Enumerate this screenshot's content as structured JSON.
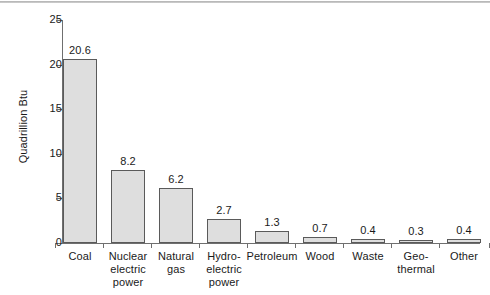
{
  "chart_data": {
    "type": "bar",
    "title": "",
    "subtitle": "",
    "xlabel": "",
    "ylabel": "Quadrillion Btu",
    "ylim": [
      0,
      25
    ],
    "ytick_values": [
      0,
      5,
      10,
      15,
      20,
      25
    ],
    "ytick_labels": [
      "0",
      "5",
      "10",
      "15",
      "20",
      "25"
    ],
    "grid": false,
    "legend": null,
    "bar_fill_color": "#dedede",
    "bar_edge_color": "#5a5a5a",
    "axis_color": "#6f6f6f",
    "categories": [
      "Coal",
      "Nuclear electric power",
      "Natural gas",
      "Hydro-electric power",
      "Petroleum",
      "Wood",
      "Waste",
      "Geo-thermal",
      "Other"
    ],
    "category_label_lines": [
      [
        "Coal"
      ],
      [
        "Nuclear",
        "electric",
        "power"
      ],
      [
        "Natural",
        "gas"
      ],
      [
        "Hydro-",
        "electric",
        "power"
      ],
      [
        "Petroleum"
      ],
      [
        "Wood"
      ],
      [
        "Waste"
      ],
      [
        "Geo-",
        "thermal"
      ],
      [
        "Other"
      ]
    ],
    "values": [
      20.6,
      8.2,
      6.2,
      2.7,
      1.3,
      0.7,
      0.4,
      0.3,
      0.4
    ],
    "value_labels": [
      "20.6",
      "8.2",
      "6.2",
      "2.7",
      "1.3",
      "0.7",
      "0.4",
      "0.3",
      "0.4"
    ]
  }
}
